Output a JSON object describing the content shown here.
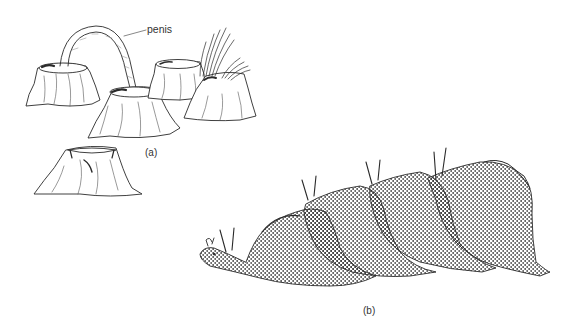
{
  "figure": {
    "panel_a": {
      "label": "(a)",
      "annotations": [
        {
          "text": "penis",
          "points_to": "arched tube between barnacles"
        }
      ],
      "subjects": [
        "barnacle-left",
        "barnacle-center-front",
        "barnacle-back",
        "barnacle-feeding-cirri",
        "barnacle-lone-bottom"
      ]
    },
    "panel_b": {
      "label": "(b)",
      "subjects": [
        "sea-hare-1",
        "sea-hare-2",
        "sea-hare-3",
        "sea-hare-4"
      ]
    },
    "colors": {
      "ink": "#2a2a2a",
      "stipple": "#c8c8c8",
      "background": "#ffffff",
      "text": "#333333"
    }
  }
}
